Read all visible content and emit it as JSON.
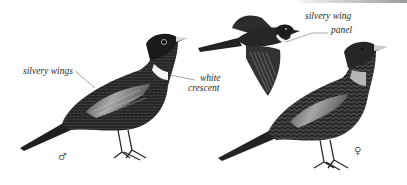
{
  "illustration": {
    "subject": "Ring Ouzel",
    "figures": [
      {
        "id": "male",
        "sex_symbol": "♂"
      },
      {
        "id": "flying"
      },
      {
        "id": "female",
        "sex_symbol": "♀"
      }
    ]
  },
  "labels": {
    "silvery_wings": "silvery wings",
    "white_crescent_line1": "white",
    "white_crescent_line2": "crescent",
    "silvery_wing_panel_line1": "silvery wing",
    "silvery_wing_panel_line2": "panel"
  },
  "symbols": {
    "male": "♂",
    "female": "♀"
  },
  "colors": {
    "plumage_dark": "#1e1e1e",
    "plumage_mid": "#3a3a3a",
    "wing_silver": "#9a9a9a",
    "crescent_male": "#f4f4f4",
    "crescent_female": "#b8b8b8",
    "bill": "#d8d8d8",
    "leader_line": "#555555"
  }
}
